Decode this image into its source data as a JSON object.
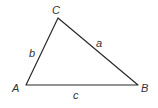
{
  "diagram": {
    "type": "triangle",
    "stroke_color": "#2a2a2a",
    "vertices": {
      "A": {
        "label": "A",
        "x": 26,
        "y": 85
      },
      "B": {
        "label": "B",
        "x": 138,
        "y": 85
      },
      "C": {
        "label": "C",
        "x": 58,
        "y": 18
      }
    },
    "sides": {
      "a": {
        "label": "a",
        "from": "B",
        "to": "C"
      },
      "b": {
        "label": "b",
        "from": "A",
        "to": "C"
      },
      "c": {
        "label": "c",
        "from": "A",
        "to": "B"
      }
    }
  }
}
